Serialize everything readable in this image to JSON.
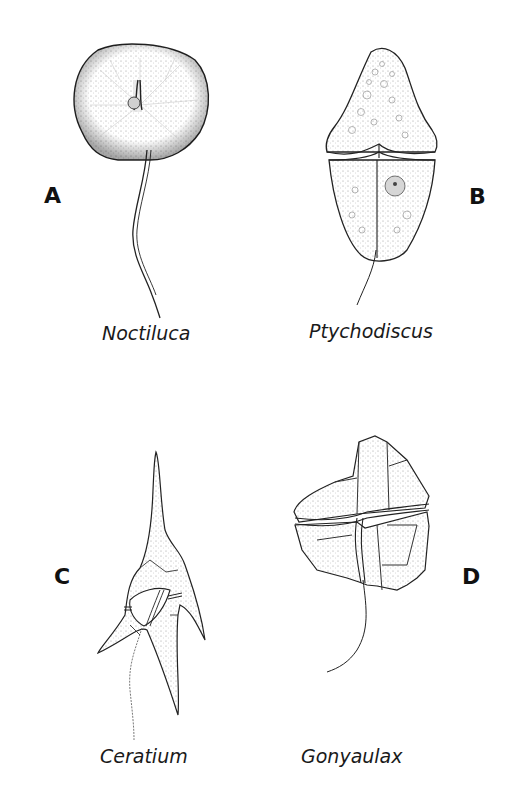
{
  "figure": {
    "panels": [
      {
        "letter": "A",
        "caption": "Noctiluca"
      },
      {
        "letter": "B",
        "caption": "Ptychodiscus"
      },
      {
        "letter": "C",
        "caption": "Ceratium"
      },
      {
        "letter": "D",
        "caption": "Gonyaulax"
      }
    ],
    "colors": {
      "ink": "#111111",
      "stipple": "#bdbdbd",
      "background": "#ffffff"
    }
  }
}
